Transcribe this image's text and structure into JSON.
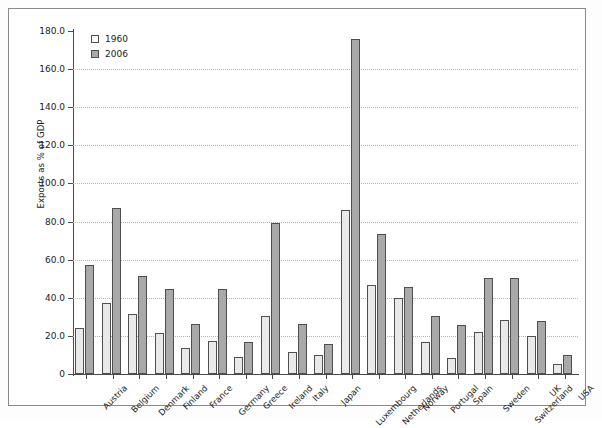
{
  "chart_data": {
    "type": "bar",
    "title": "",
    "xlabel": "",
    "ylabel": "Exports as % of GDP",
    "ylim": [
      0,
      180
    ],
    "ytick_step": 20,
    "ytick_labels": [
      "180.0",
      "160.0",
      "140.0",
      "120.0",
      "100.0",
      "80.0",
      "60.0",
      "40.0",
      "20.0",
      "0"
    ],
    "grid": true,
    "legend_position": "top-left",
    "categories": [
      "Austria",
      "Belgium",
      "Denmark",
      "Finland",
      "France",
      "Germany",
      "Greece",
      "Ireland",
      "Italy",
      "Japan",
      "Luxembourg",
      "Netherlands",
      "Norway",
      "Portugal",
      "Spain",
      "Sweden",
      "Switzerland",
      "UK",
      "USA"
    ],
    "series": [
      {
        "name": "1960",
        "color": "#e9e9e9",
        "values": [
          24.0,
          37.5,
          31.5,
          21.5,
          13.5,
          17.5,
          9.0,
          30.5,
          11.5,
          10.0,
          86.0,
          46.5,
          40.0,
          17.0,
          8.5,
          22.0,
          28.5,
          20.0,
          5.0
        ]
      },
      {
        "name": "2006",
        "color": "#a9a9a9",
        "values": [
          57.0,
          87.0,
          51.5,
          44.5,
          26.5,
          44.5,
          17.0,
          79.5,
          26.5,
          15.5,
          176.0,
          73.5,
          45.5,
          30.5,
          25.5,
          50.5,
          50.5,
          28.0,
          10.0
        ]
      }
    ]
  },
  "legend": {
    "entries": [
      {
        "label": "1960"
      },
      {
        "label": "2006"
      }
    ]
  },
  "axes": {
    "y_title": "Exports as % of GDP"
  }
}
